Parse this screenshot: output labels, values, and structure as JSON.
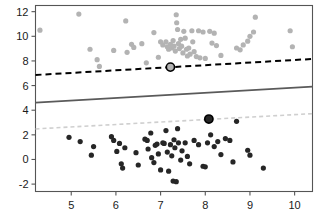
{
  "chart_data": {
    "type": "scatter",
    "title": "",
    "subtitle": "",
    "xlabel": "",
    "ylabel": "",
    "xlim": [
      4.2,
      10.4
    ],
    "ylim": [
      -2.6,
      12.5
    ],
    "xticks": [
      5,
      6,
      7,
      8,
      9,
      10
    ],
    "yticks": [
      -2,
      0,
      2,
      4,
      6,
      8,
      10,
      12
    ],
    "xticklabels": [
      "5",
      "6",
      "7",
      "8",
      "9",
      "10"
    ],
    "yticklabels": [
      "-2",
      "0",
      "2",
      "4",
      "6",
      "8",
      "10",
      "12"
    ],
    "grid": false,
    "legend": "none",
    "frame": true,
    "colors": {
      "group_upper": "#b3b3b3",
      "group_lower": "#262626",
      "line_upper": "#000000",
      "line_middle": "#5a5a5a",
      "line_lower": "#cfcfcf",
      "axis": "#555555",
      "background": "#ffffff",
      "highlight_ring": "#000000"
    },
    "marker": {
      "shape": "circle",
      "size_px": 5.2
    },
    "series": [
      {
        "name": "upper-group",
        "color": "#b3b3b3",
        "points": [
          [
            4.3,
            10.5
          ],
          [
            5.17,
            11.8
          ],
          [
            5.42,
            8.95
          ],
          [
            5.58,
            8.1
          ],
          [
            5.63,
            7.55
          ],
          [
            5.95,
            8.85
          ],
          [
            6.22,
            11.25
          ],
          [
            6.25,
            8.7
          ],
          [
            6.35,
            9.35
          ],
          [
            6.4,
            9.1
          ],
          [
            6.58,
            9.4
          ],
          [
            6.68,
            7.85
          ],
          [
            6.85,
            10.3
          ],
          [
            6.95,
            8.3
          ],
          [
            7.0,
            9.55
          ],
          [
            7.05,
            9.3
          ],
          [
            7.12,
            9.55
          ],
          [
            7.15,
            9.15
          ],
          [
            7.18,
            8.95
          ],
          [
            7.22,
            9.35
          ],
          [
            7.25,
            9.05
          ],
          [
            7.28,
            9.65
          ],
          [
            7.3,
            9.2
          ],
          [
            7.33,
            8.8
          ],
          [
            7.35,
            11.75
          ],
          [
            7.36,
            11.1
          ],
          [
            7.38,
            10.55
          ],
          [
            7.4,
            9.4
          ],
          [
            7.42,
            9.0
          ],
          [
            7.45,
            9.75
          ],
          [
            7.47,
            9.2
          ],
          [
            7.5,
            8.65
          ],
          [
            7.52,
            10.4
          ],
          [
            7.55,
            9.85
          ],
          [
            7.58,
            8.95
          ],
          [
            7.6,
            8.4
          ],
          [
            7.63,
            9.05
          ],
          [
            7.66,
            8.55
          ],
          [
            7.7,
            10.45
          ],
          [
            7.72,
            9.55
          ],
          [
            7.75,
            8.75
          ],
          [
            7.8,
            8.35
          ],
          [
            7.85,
            10.45
          ],
          [
            7.88,
            8.25
          ],
          [
            7.95,
            10.35
          ],
          [
            8.0,
            8.2
          ],
          [
            8.1,
            10.4
          ],
          [
            8.15,
            9.45
          ],
          [
            8.2,
            10.25
          ],
          [
            8.25,
            9.25
          ],
          [
            8.35,
            8.45
          ],
          [
            8.7,
            9.05
          ],
          [
            8.78,
            8.9
          ],
          [
            8.85,
            9.3
          ],
          [
            8.95,
            9.6
          ],
          [
            9.0,
            10.0
          ],
          [
            9.08,
            10.35
          ],
          [
            9.12,
            11.55
          ],
          [
            9.9,
            10.45
          ],
          [
            9.95,
            9.15
          ]
        ]
      },
      {
        "name": "lower-group",
        "color": "#262626",
        "points": [
          [
            4.95,
            1.8
          ],
          [
            5.2,
            1.45
          ],
          [
            5.45,
            0.35
          ],
          [
            5.5,
            1.05
          ],
          [
            5.9,
            1.85
          ],
          [
            5.95,
            1.55
          ],
          [
            6.02,
            0.65
          ],
          [
            6.08,
            1.3
          ],
          [
            6.12,
            -0.35
          ],
          [
            6.15,
            -0.7
          ],
          [
            6.2,
            0.95
          ],
          [
            6.45,
            0.55
          ],
          [
            6.5,
            -0.45
          ],
          [
            6.65,
            1.65
          ],
          [
            6.7,
            1.55
          ],
          [
            6.72,
            0.85
          ],
          [
            6.78,
            2.15
          ],
          [
            6.8,
            0.15
          ],
          [
            6.85,
            -0.25
          ],
          [
            6.88,
            1.15
          ],
          [
            6.92,
            1.25
          ],
          [
            6.95,
            0.45
          ],
          [
            7.0,
            -0.85
          ],
          [
            7.05,
            1.35
          ],
          [
            7.08,
            1.3
          ],
          [
            7.12,
            2.35
          ],
          [
            7.15,
            0.6
          ],
          [
            7.18,
            -0.95
          ],
          [
            7.22,
            1.2
          ],
          [
            7.25,
            0.3
          ],
          [
            7.28,
            -1.75
          ],
          [
            7.3,
            1.6
          ],
          [
            7.32,
            0.95
          ],
          [
            7.35,
            -1.8
          ],
          [
            7.38,
            2.5
          ],
          [
            7.4,
            1.35
          ],
          [
            7.45,
            -0.05
          ],
          [
            7.48,
            0.7
          ],
          [
            7.55,
            1.35
          ],
          [
            7.6,
            0.25
          ],
          [
            7.65,
            -0.35
          ],
          [
            7.75,
            1.55
          ],
          [
            7.85,
            1.2
          ],
          [
            7.95,
            -0.55
          ],
          [
            8.0,
            -0.6
          ],
          [
            8.05,
            1.35
          ],
          [
            8.12,
            2.0
          ],
          [
            8.2,
            1.05
          ],
          [
            8.28,
            1.45
          ],
          [
            8.35,
            0.4
          ],
          [
            8.45,
            1.7
          ],
          [
            8.55,
            1.55
          ],
          [
            8.62,
            -0.2
          ],
          [
            8.7,
            3.1
          ],
          [
            8.95,
            0.75
          ],
          [
            9.0,
            0.35
          ],
          [
            9.3,
            -0.7
          ]
        ]
      }
    ],
    "highlighted_points": [
      {
        "name": "upper-highlight",
        "x": 7.22,
        "y": 7.5,
        "fill": "#b3b3b3",
        "ring": "#000000"
      },
      {
        "name": "lower-highlight",
        "x": 8.08,
        "y": 3.28,
        "fill": "#262626",
        "ring": "#000000"
      }
    ],
    "lines": [
      {
        "name": "upper-boundary",
        "style": "dashed",
        "color": "#000000",
        "width": 2.0,
        "x0": 4.2,
        "y0": 6.86,
        "x1": 10.4,
        "y1": 8.16
      },
      {
        "name": "middle-boundary",
        "style": "solid",
        "color": "#5a5a5a",
        "width": 1.8,
        "x0": 4.2,
        "y0": 4.62,
        "x1": 10.4,
        "y1": 5.92
      },
      {
        "name": "lower-boundary",
        "style": "dashed",
        "color": "#cfcfcf",
        "width": 1.6,
        "x0": 4.2,
        "y0": 2.48,
        "x1": 10.4,
        "y1": 3.72
      }
    ]
  }
}
